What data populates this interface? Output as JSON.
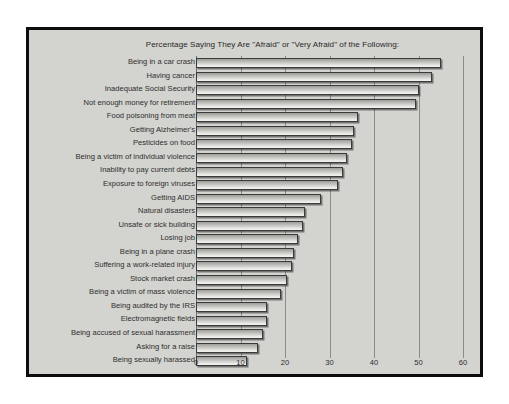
{
  "chart_data": {
    "type": "bar",
    "orientation": "horizontal",
    "title": "Percentage Saying They Are \"Afraid\" or \"Very Afraid\" of the Following:",
    "xlabel": "",
    "ylabel": "",
    "xlim": [
      0,
      60
    ],
    "xticks": [
      0,
      10,
      20,
      30,
      40,
      50,
      60
    ],
    "xtick_labels": [
      "0",
      "10",
      "20",
      "30",
      "40",
      "50",
      "60"
    ],
    "grid": true,
    "grid_axis": "x",
    "legend": false,
    "categories": [
      "Being in a car crash",
      "Having cancer",
      "Inadequate Social Security",
      "Not enough money for retirement",
      "Food poisoning from meat",
      "Getting Alzheimer's",
      "Pesticides on food",
      "Being a victim of individual violence",
      "Inability to pay current debts",
      "Exposure to foreign viruses",
      "Getting AIDS",
      "Natural disasters",
      "Unsafe or sick building",
      "Losing job",
      "Being in a plane crash",
      "Suffering a work-related injury",
      "Stock market crash",
      "Being a victim of mass violence",
      "Being audited by the IRS",
      "Electromagnetic fields",
      "Being accused of sexual harassment",
      "Asking for a raise",
      "Being sexually harassed"
    ],
    "values": [
      55,
      53,
      50,
      49.5,
      36.5,
      35.5,
      35,
      34,
      33,
      32,
      28,
      24.5,
      24,
      23,
      22,
      21.5,
      20.5,
      19,
      16,
      16,
      15,
      14,
      11.5
    ]
  },
  "colors": {
    "frame_border": "#0d0d0d",
    "plot_background": "#d3d3cf",
    "page_background": "#ffffff",
    "bar_outline": "#3a3a38",
    "gridline": "#8b8b87",
    "text": "#2e2e2e"
  }
}
